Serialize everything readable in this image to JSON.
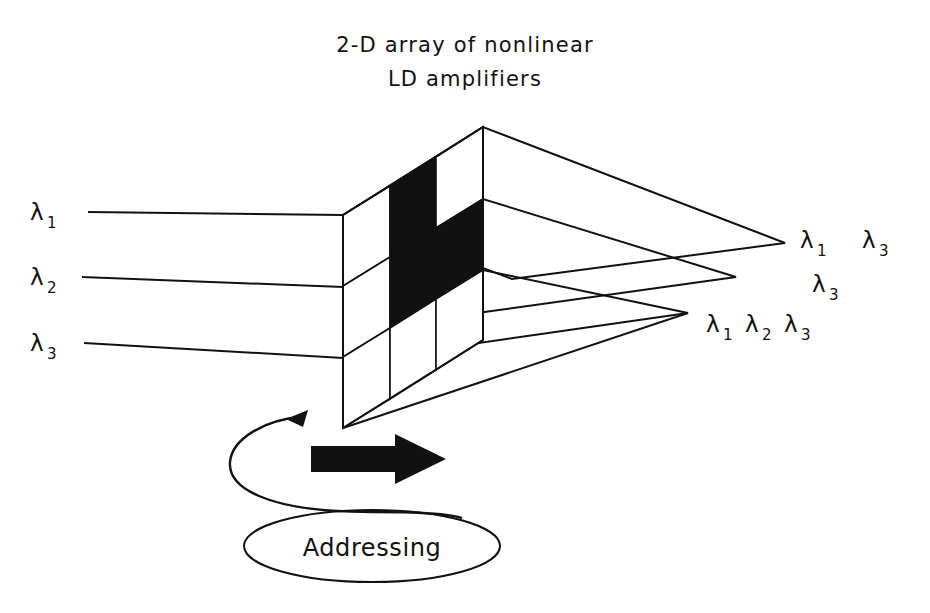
{
  "figure": {
    "title_line1": "2-D array of nonlinear",
    "title_line2": "LD amplifiers",
    "addressing_label": "Addressing"
  },
  "inputs": [
    {
      "symbol": "λ",
      "subscript": "1"
    },
    {
      "symbol": "λ",
      "subscript": "2"
    },
    {
      "symbol": "λ",
      "subscript": "3"
    }
  ],
  "outputs": [
    {
      "group": [
        "λ1",
        "λ3"
      ],
      "row": "top"
    },
    {
      "group": [
        "λ3"
      ],
      "row": "middle"
    },
    {
      "group": [
        "λ1",
        "λ2",
        "λ3"
      ],
      "row": "bottom"
    }
  ],
  "output_glyphs": {
    "top": [
      {
        "symbol": "λ",
        "subscript": "1"
      },
      {
        "symbol": "λ",
        "subscript": "3"
      }
    ],
    "middle": [
      {
        "symbol": "λ",
        "subscript": "3"
      }
    ],
    "bottom": [
      {
        "symbol": "λ",
        "subscript": "1"
      },
      {
        "symbol": "λ",
        "subscript": "2"
      },
      {
        "symbol": "λ",
        "subscript": "3"
      }
    ]
  },
  "array": {
    "rows": 3,
    "cols": 3,
    "pattern": [
      [
        0,
        1,
        0
      ],
      [
        0,
        1,
        1
      ],
      [
        0,
        0,
        0
      ]
    ],
    "on_color": "#111111",
    "off_color": "#ffffff"
  },
  "colors": {
    "ink": "#111111",
    "background": "#ffffff"
  }
}
